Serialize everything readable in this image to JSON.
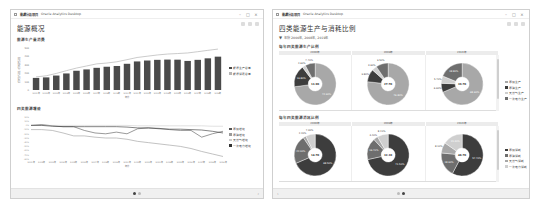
{
  "left_window": {
    "titlebar": {
      "project": "能源分析项目",
      "app": "Oracle Analytics Desktop",
      "minimize": "–",
      "maximize": "□",
      "close": "×"
    },
    "page_title": "能源概况",
    "chart1": {
      "title": "能源生产量消费",
      "legend": [
        "能源生产总量",
        "能源消费总量"
      ]
    },
    "chart2": {
      "title": "四类能源增速",
      "legend": [
        "原煤增速",
        "原油增速",
        "天然气增速",
        "一次电力增速"
      ]
    },
    "pager": {
      "pages": 2,
      "active": 0
    }
  },
  "right_window": {
    "titlebar": {
      "project": "能源分析项目",
      "app": "Oracle Analytics Desktop",
      "minimize": "–",
      "maximize": "□",
      "close": "×"
    },
    "page_title": "四类能源生产与消耗比例",
    "filter": {
      "icon": "filter-icon",
      "text": "年份 2000年, 2008年, 2019年"
    },
    "row1": {
      "title": "每年四类能源生产比例",
      "columns": [
        "2000年",
        "2008年",
        "2019年"
      ],
      "legend": [
        "原煤生产",
        "原油生产",
        "天然气生产",
        "一次电力生产"
      ]
    },
    "row2": {
      "title": "每年四类能源消耗比例",
      "columns": [
        "2000年",
        "2008年",
        "2019年"
      ],
      "legend": [
        "原煤消耗",
        "原油消耗",
        "天然气消耗",
        "一次电力消耗"
      ]
    },
    "pager": {
      "pages": 2,
      "active": 1
    }
  },
  "chart_data": [
    {
      "type": "bar",
      "title": "能源生产量消费",
      "xlabel": "年份",
      "ylabel": "能源生产总量 / 能源消费总量",
      "categories": [
        "2001年",
        "2002年",
        "2003年",
        "2004年",
        "2005年",
        "2006年",
        "2007年",
        "2008年",
        "2009年",
        "2010年",
        "2011年",
        "2012年",
        "2013年",
        "2014年",
        "2015年",
        "2016年",
        "2017年",
        "2018年",
        "2019年"
      ],
      "series": [
        {
          "name": "能源生产总量",
          "kind": "bar",
          "values": [
            14.4,
            15.0,
            17.2,
            19.7,
            22.9,
            24.5,
            26.4,
            27.7,
            28.6,
            31.2,
            34.0,
            35.1,
            35.9,
            36.2,
            36.1,
            34.6,
            35.9,
            37.7,
            39.7
          ]
        },
        {
          "name": "能源消费总量",
          "kind": "line",
          "values": [
            15.6,
            16.9,
            19.7,
            23.0,
            26.1,
            28.6,
            31.1,
            32.1,
            33.6,
            36.1,
            38.7,
            40.2,
            41.7,
            42.8,
            43.4,
            44.1,
            45.6,
            47.2,
            48.7
          ]
        }
      ],
      "ylim": [
        0,
        50
      ],
      "yticks": [
        "0",
        "10K",
        "20K",
        "30K",
        "40K",
        "50K"
      ],
      "legend_position": "right"
    },
    {
      "type": "line",
      "title": "四类能源增速",
      "xlabel": "年份",
      "categories": [
        "2001年",
        "2002年",
        "2003年",
        "2004年",
        "2005年",
        "2006年",
        "2007年",
        "2008年",
        "2009年",
        "2010年",
        "2011年",
        "2012年",
        "2013年",
        "2014年",
        "2015年",
        "2016年",
        "2017年",
        "2018年",
        "2019年"
      ],
      "series": [
        {
          "name": "原煤增速",
          "values": [
            0,
            2,
            -1,
            -3,
            -3,
            -12,
            -18,
            -20,
            -16,
            -20,
            -8,
            -6,
            -7,
            -10,
            -12,
            -12,
            -28,
            -20,
            -14
          ]
        },
        {
          "name": "原油增速",
          "values": [
            -10,
            -10,
            -12,
            -18,
            -25,
            -25,
            -28,
            -30,
            -30,
            -33,
            -38,
            -41,
            -44,
            -47,
            -50,
            -55,
            -62,
            -68,
            -74
          ]
        },
        {
          "name": "天然气增速",
          "values": [
            0,
            0,
            0,
            0,
            0,
            0,
            0,
            0,
            0,
            0,
            -1,
            -1,
            -1,
            -1,
            -1,
            -1,
            -1,
            -2,
            -2
          ]
        },
        {
          "name": "一次电力增速",
          "values": [
            0,
            0,
            -2,
            -3,
            -3,
            -3,
            -3,
            -3,
            -3,
            -4,
            -6,
            -6,
            -8,
            -9,
            -9,
            -10,
            -11,
            -14,
            -18
          ]
        }
      ],
      "ylim": [
        -80,
        20
      ],
      "legend_position": "right"
    },
    {
      "type": "pie",
      "title": "每年四类能源生产比例",
      "donuts": [
        {
          "label": "2000年",
          "center": "13.9K",
          "slices": [
            {
              "name": "原煤生产",
              "value": 72.9
            },
            {
              "name": "原油生产",
              "value": 16.8
            },
            {
              "name": "天然气生产",
              "value": 2.6
            },
            {
              "name": "一次电力生产",
              "value": 7.7
            }
          ]
        },
        {
          "name_hint": "2008年",
          "label": "2008年",
          "center": "27.7K",
          "slices": [
            {
              "name": "原煤生产",
              "value": 76.8
            },
            {
              "name": "原油生产",
              "value": 9.8
            },
            {
              "name": "天然气生产",
              "value": 3.9
            },
            {
              "name": "一次电力生产",
              "value": 9.5
            }
          ]
        },
        {
          "label": "2019年",
          "center": "39.7K",
          "slices": [
            {
              "name": "原煤生产",
              "value": 68.6
            },
            {
              "name": "原油生产",
              "value": 6.9
            },
            {
              "name": "天然气生产",
              "value": 5.7
            },
            {
              "name": "一次电力生产",
              "value": 18.8
            }
          ]
        }
      ]
    },
    {
      "type": "pie",
      "title": "每年四类能源消耗比例",
      "donuts": [
        {
          "label": "2000年",
          "center": "14.7K",
          "slices": [
            {
              "name": "原煤消耗",
              "value": 68.5
            },
            {
              "name": "原油消耗",
              "value": 22.0
            },
            {
              "name": "天然气消耗",
              "value": 2.2
            },
            {
              "name": "一次电力消耗",
              "value": 7.3
            }
          ]
        },
        {
          "label": "2008年",
          "center": "32.1K",
          "slices": [
            {
              "name": "原煤消耗",
              "value": 71.5
            },
            {
              "name": "原油消耗",
              "value": 16.7
            },
            {
              "name": "天然气消耗",
              "value": 3.4
            },
            {
              "name": "一次电力消耗",
              "value": 8.4
            }
          ]
        },
        {
          "label": "2019年",
          "center": "48.7K",
          "slices": [
            {
              "name": "原煤消耗",
              "value": 57.7
            },
            {
              "name": "原油消耗",
              "value": 18.9
            },
            {
              "name": "天然气消耗",
              "value": 8.1
            },
            {
              "name": "一次电力消耗",
              "value": 15.3
            }
          ]
        }
      ]
    }
  ],
  "colors": {
    "bar": "#4a4a4a",
    "line_light": "#b5b5b5",
    "slice_dark": "#3d3d3d",
    "slice_mid": "#6e6e6e",
    "slice_light": "#a8a8a8",
    "slice_lighter": "#cfcfcf"
  }
}
